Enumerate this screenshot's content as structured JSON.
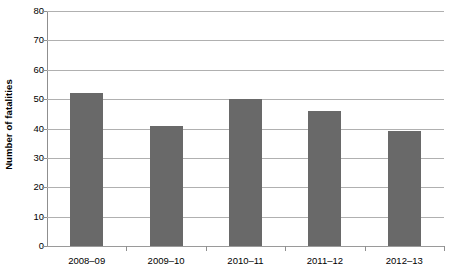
{
  "chart_data": {
    "type": "bar",
    "title": "",
    "xlabel": "",
    "ylabel": "Number of fatalities",
    "categories": [
      "2008–09",
      "2009–10",
      "2010–11",
      "2011–12",
      "2012–13"
    ],
    "values": [
      52,
      41,
      50,
      46,
      39
    ],
    "ylim": [
      0,
      80
    ],
    "ytick_values": [
      0,
      10,
      20,
      30,
      40,
      50,
      60,
      70,
      80
    ],
    "ytick_labels": [
      "0",
      "10",
      "20",
      "30",
      "40",
      "50",
      "60",
      "70",
      "80"
    ],
    "grid": true,
    "legend": false,
    "legend_position": "none",
    "series": [
      {
        "name": "Number of fatalities",
        "values": [
          52,
          41,
          50,
          46,
          39
        ]
      }
    ],
    "colors": {
      "bar_fill": "#696969",
      "gridline": "#b0b0b0",
      "axis_line": "#8f8f8f",
      "text": "#000000",
      "background": "#ffffff"
    }
  }
}
